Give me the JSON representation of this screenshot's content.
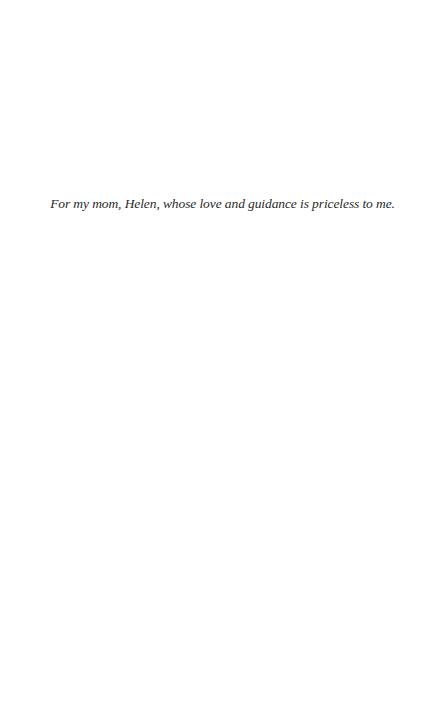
{
  "page": {
    "dedication": "For my mom, Helen, whose love and guidance is priceless to me."
  }
}
